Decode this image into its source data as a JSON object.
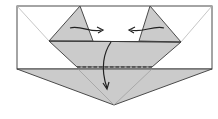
{
  "diagram": {
    "type": "origami-fold-step",
    "colors": {
      "paper_white": "#ffffff",
      "paper_colored": "#cbcbcb",
      "edge": "#4a4a4a",
      "crease": "#b0b0b0",
      "arrow": "#222222"
    },
    "elements": [
      {
        "name": "white-rectangle",
        "description": "unfolded white paper region"
      },
      {
        "name": "left-flap",
        "description": "grey triangular flap, folds right"
      },
      {
        "name": "right-flap",
        "description": "grey triangular flap, folds left"
      },
      {
        "name": "middle-band",
        "description": "grey trapezoid band"
      },
      {
        "name": "bottom-triangle",
        "description": "grey bottom point"
      },
      {
        "name": "valley-fold-line",
        "description": "dashed fold line"
      },
      {
        "name": "arrow-left-flap",
        "description": "curved arrow pointing right"
      },
      {
        "name": "arrow-right-flap",
        "description": "curved arrow pointing left"
      },
      {
        "name": "arrow-center-down",
        "description": "curved arrow pointing down"
      }
    ]
  }
}
